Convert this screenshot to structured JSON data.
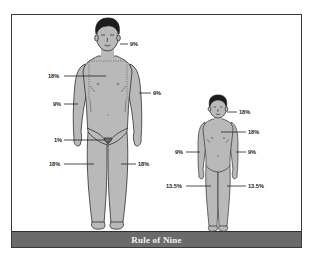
{
  "caption": "Rule of Nine",
  "colors": {
    "skin": "#b9b9b9",
    "outline": "#2f2f2f",
    "hair": "#1c1c1c",
    "banner": "#6a6a6a",
    "banner_text": "#f2f2f2"
  },
  "adult": {
    "label": "Adult figure",
    "regions": [
      {
        "name": "head",
        "value": "9%"
      },
      {
        "name": "trunk",
        "value": "18%"
      },
      {
        "name": "left-arm",
        "value": "9%"
      },
      {
        "name": "right-arm",
        "value": "9%"
      },
      {
        "name": "genitals",
        "value": "1%"
      },
      {
        "name": "left-leg",
        "value": "18%"
      },
      {
        "name": "right-leg",
        "value": "18%"
      }
    ]
  },
  "child": {
    "label": "Child figure",
    "regions": [
      {
        "name": "head",
        "value": "18%"
      },
      {
        "name": "trunk",
        "value": "18%"
      },
      {
        "name": "left-arm",
        "value": "9%"
      },
      {
        "name": "right-arm",
        "value": "9%"
      },
      {
        "name": "left-leg",
        "value": "13.5%"
      },
      {
        "name": "right-leg",
        "value": "13.5%"
      }
    ]
  }
}
